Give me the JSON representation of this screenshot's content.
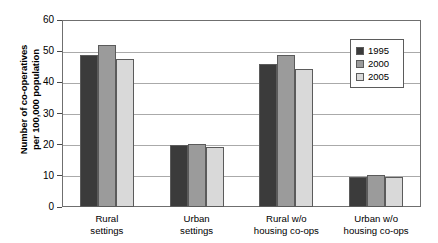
{
  "chart_data": {
    "type": "bar",
    "title": "",
    "xlabel": "",
    "ylabel": "Number of co-operatives per 100,000 population",
    "ylabel_line1": "Number of co-operatives",
    "ylabel_line2": "per 100,000 population",
    "ylim": [
      0,
      60
    ],
    "ytick_labels": [
      "0",
      "10",
      "20",
      "30",
      "40",
      "50",
      "60"
    ],
    "ytick_values": [
      0,
      10,
      20,
      30,
      40,
      50,
      60
    ],
    "grid": "horizontal",
    "legend_position": "top-right",
    "categories": [
      "Rural settings",
      "Urban settings",
      "Rural w/o housing co-ops",
      "Urban w/o housing co-ops"
    ],
    "category_lines": [
      [
        "Rural",
        "settings"
      ],
      [
        "Urban",
        "settings"
      ],
      [
        "Rural w/o",
        "housing co-ops"
      ],
      [
        "Urban w/o",
        "housing co-ops"
      ]
    ],
    "series": [
      {
        "name": "1995",
        "color": "#3b3b3b",
        "values": [
          48.7,
          19.9,
          46.0,
          9.6
        ]
      },
      {
        "name": "2000",
        "color": "#9b9b9b",
        "values": [
          52.0,
          20.2,
          48.8,
          10.2
        ]
      },
      {
        "name": "2005",
        "color": "#d9d9d9",
        "values": [
          47.6,
          19.1,
          44.3,
          9.5
        ]
      }
    ]
  },
  "legend": {
    "entries": [
      {
        "label": "1995",
        "color": "#3b3b3b"
      },
      {
        "label": "2000",
        "color": "#9b9b9b"
      },
      {
        "label": "2005",
        "color": "#d9d9d9"
      }
    ]
  }
}
